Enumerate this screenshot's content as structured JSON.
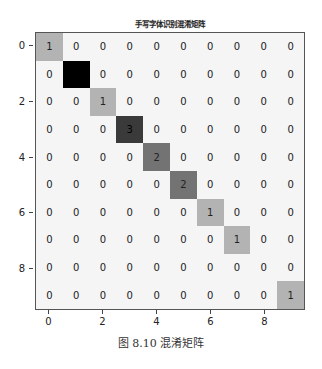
{
  "chart_data": {
    "type": "heatmap",
    "title": "手写字体识别混淆矩阵",
    "caption": "图 8.10 混淆矩阵",
    "xlabel": "",
    "ylabel": "",
    "x_ticks": [
      0,
      2,
      4,
      6,
      8
    ],
    "y_ticks": [
      0,
      2,
      4,
      6,
      8
    ],
    "rows": 10,
    "cols": 10,
    "colormap": "Greys",
    "matrix": [
      [
        1,
        0,
        0,
        0,
        0,
        0,
        0,
        0,
        0,
        0
      ],
      [
        0,
        4,
        0,
        0,
        0,
        0,
        0,
        0,
        0,
        0
      ],
      [
        0,
        0,
        1,
        0,
        0,
        0,
        0,
        0,
        0,
        0
      ],
      [
        0,
        0,
        0,
        3,
        0,
        0,
        0,
        0,
        0,
        0
      ],
      [
        0,
        0,
        0,
        0,
        2,
        0,
        0,
        0,
        0,
        0
      ],
      [
        0,
        0,
        0,
        0,
        0,
        2,
        0,
        0,
        0,
        0
      ],
      [
        0,
        0,
        0,
        0,
        0,
        0,
        1,
        0,
        0,
        0
      ],
      [
        0,
        0,
        0,
        0,
        0,
        0,
        0,
        1,
        0,
        0
      ],
      [
        0,
        0,
        0,
        0,
        0,
        0,
        0,
        0,
        0,
        0
      ],
      [
        0,
        0,
        0,
        0,
        0,
        0,
        0,
        0,
        0,
        1
      ]
    ],
    "value_colors": {
      "0": "#f5f5f5",
      "1": "#b3b3b3",
      "2": "#737373",
      "3": "#3a3a3a",
      "4": "#000000"
    }
  }
}
